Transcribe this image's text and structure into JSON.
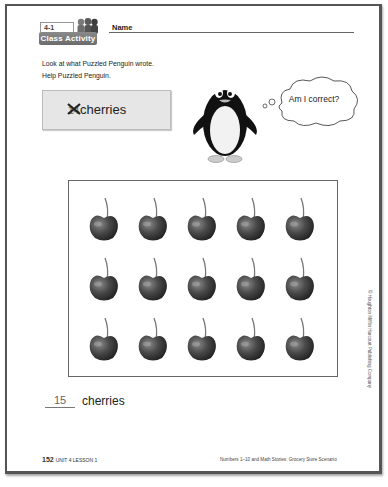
{
  "header": {
    "lesson_number": "4-1",
    "badge_label": "Class Activity",
    "name_label": "Name"
  },
  "instructions": [
    "Look at what Puzzled Penguin wrote.",
    "Help Puzzled Penguin."
  ],
  "penguin_answer": {
    "crossed_out_number": "14",
    "word": "cherries"
  },
  "thought_bubble": {
    "text": "Am I correct?"
  },
  "cherry_grid": {
    "rows": 3,
    "columns": 5,
    "count": 15,
    "item": "cherry"
  },
  "student_answer": {
    "value": "15",
    "word": "cherries"
  },
  "footer": {
    "page_number": "152",
    "unit_lesson": "UNIT 4 LESSON 1",
    "chapter_title": "Numbers 1–10 and Math Stories: Grocery Store Scenario",
    "copyright": "© Houghton Mifflin Harcourt Publishing Company"
  }
}
